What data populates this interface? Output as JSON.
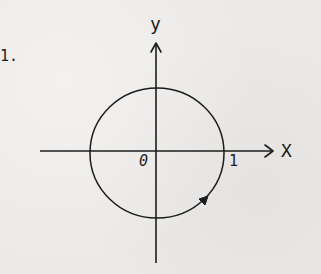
{
  "problem": {
    "number": "1."
  },
  "axes": {
    "x_label": "X",
    "y_label": "y",
    "origin_label": "0",
    "unit_tick_label": "1"
  },
  "figure": {
    "shape": "unit circle",
    "center": [
      0,
      0
    ],
    "radius": 1,
    "orientation": "counterclockwise",
    "orientation_arrow_quadrant": "IV",
    "stroke_color": "#1c1c1c",
    "background_color": "#eceae8"
  }
}
